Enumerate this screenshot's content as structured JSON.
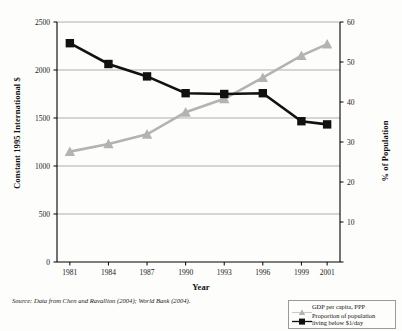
{
  "chart": {
    "type": "line",
    "xlabel": "Year",
    "ylabel_left": "Constant 1995 International $",
    "ylabel_right": "% of Population",
    "source_note": "Source: Data from Chen and Ravallion (2004); World Bank (2004).",
    "colors": {
      "gdp_series": "#b3b3b3",
      "poverty_series": "#111111",
      "grid": "#8c8c8c",
      "axis": "#000000",
      "background": "#fdfdfb"
    }
  },
  "chart_data": {
    "type": "line",
    "title": "",
    "xlabel": "Year",
    "ylabel": "Constant 1995 International $",
    "ylabel_secondary": "% of Population",
    "grid": true,
    "legend_position": "bottom-right",
    "x": [
      1981,
      1984,
      1987,
      1990,
      1993,
      1996,
      1999,
      2001
    ],
    "xticklabels": [
      "1981",
      "1984",
      "1987",
      "1990",
      "1993",
      "1996",
      "1999",
      "2001"
    ],
    "xlim": [
      1980,
      2002
    ],
    "ylim_left": [
      0,
      2500
    ],
    "yticks_left": [
      0,
      500,
      1000,
      1500,
      2000,
      2500
    ],
    "yticklabels_left": [
      "0",
      "500",
      "1000",
      "1500",
      "2000",
      "2500"
    ],
    "ylim_right": [
      0,
      60
    ],
    "yticks_right": [
      0,
      10,
      20,
      30,
      40,
      50,
      60
    ],
    "yticklabels_right": [
      "0",
      "10",
      "20",
      "30",
      "40",
      "50",
      "60"
    ],
    "series": [
      {
        "name": "GDP per capita, PPP",
        "axis": "left",
        "marker": "triangle",
        "color": "#b3b3b3",
        "unit": "Constant 1995 International $",
        "values": [
          1150,
          1230,
          1330,
          1560,
          1700,
          1920,
          2150,
          2270
        ]
      },
      {
        "name": "Proportion of population living below $1/day",
        "axis": "right",
        "marker": "square",
        "color": "#111111",
        "unit": "% of Population",
        "values": [
          54.7,
          49.5,
          46.4,
          42.2,
          42.0,
          42.2,
          35.2,
          34.4
        ]
      }
    ]
  },
  "legend": {
    "items": [
      {
        "label": "GDP per capita, PPP",
        "label_line2": ""
      },
      {
        "label": "Proportion of population",
        "label_line2": "living below $1/day"
      }
    ]
  }
}
